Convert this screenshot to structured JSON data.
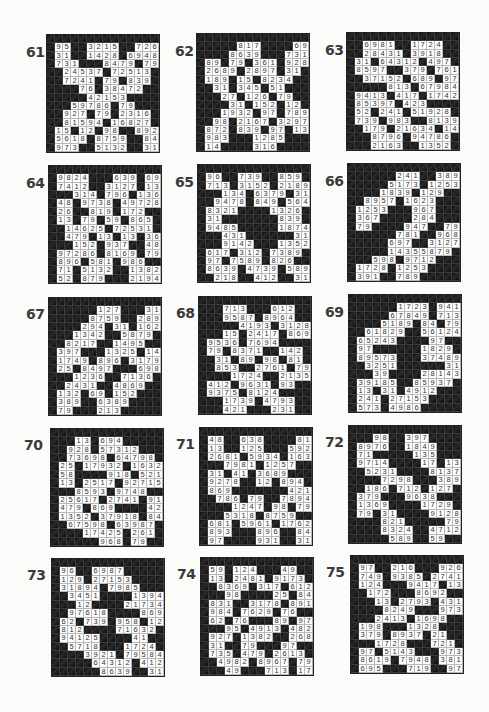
{
  "page": {
    "background": "#fbfbfa",
    "puzzle_label_color": "#3a3a3a",
    "black_cell_color": "#141414",
    "white_cell_color": "#fdfdfd"
  },
  "legend": {
    "black_symbol": "#",
    "empty_symbol": ".",
    "note": "Each grid is 14x14: first row and first column are black header cells; rows below list the 13 remaining rows, 13 chars each."
  },
  "puzzles": [
    {
      "number": "61",
      "label_pos": [
        26,
        44
      ],
      "grid_pos": [
        46,
        34
      ],
      "rows": [
        "95##3215##726",
        "31##1428#6948",
        "731###8479#79",
        "#24537#72513#",
        "#7241#79#839#",
        "###76#38472##",
        "####42153####",
        "##59786#79###",
        "#927#79#2316#",
        "#81594#16827#",
        "15#12#98##892",
        "5618#8759##84",
        "973##5132##31"
      ]
    },
    {
      "number": "62",
      "label_pos": [
        175,
        43
      ],
      "grid_pos": [
        196,
        33
      ],
      "rows": [
        "####817####69",
        "###8639###731",
        "89#79#361#928",
        "2689#2897#31#",
        "189#15#8234##",
        "#31#345#51###",
        "##27#126#79##",
        "###31#152#12#",
        "##1932#97#789",
        "#98#2167#3297",
        "872#839#97#13",
        "983###1285###",
        "14####316####"
      ]
    },
    {
      "number": "63",
      "label_pos": [
        325,
        42
      ],
      "grid_pos": [
        346,
        32
      ],
      "rows": [
        "#6981##1724##",
        "#28431#3918##",
        "31#64312#497#",
        "8597##379#761",
        "#37152#689#97",
        "####813#67984",
        "9413#417#1742",
        "85397#423####",
        "52#241#51928#",
        "739#983##8139",
        "#179#21634#14",
        "##8796#94786#",
        "##2163##1352#"
      ]
    },
    {
      "number": "64",
      "label_pos": [
        26,
        175
      ],
      "grid_pos": [
        48,
        165
      ],
      "rows": [
        "9824###639#69",
        "7412##3127#13",
        "##314#796#136",
        "48#9738#49728",
        "26##819#172##",
        "13#79#59#865#",
        "#14625#72531#",
        "#479#13#13#36",
        "##152#937##48",
        "97286#8169#79",
        "896#581#986##",
        "71#5132##1382",
        "52#879###2194"
      ]
    },
    {
      "number": "65",
      "label_pos": [
        175,
        174
      ],
      "grid_pos": [
        197,
        164
      ],
      "rows": [
        "96##739##859#",
        "713#3152#2189",
        "##134#6379#31",
        "#9478#849#564",
        "8321####1326#",
        "31#######839#",
        "9485#####1874",
        "##431######31",
        "##9142###1352",
        "617#312#7389#",
        "97#7589#826##",
        "8639#4739#589",
        "#218##412##31"
      ]
    },
    {
      "number": "66",
      "label_pos": [
        325,
        173
      ],
      "grid_pos": [
        347,
        163
      ],
      "rows": [
        "#####241##389",
        "####5173#1253",
        "###1839#129##",
        "#8957#1623###",
        "1253###967###",
        "367####284###",
        "79####947##79",
        "#####781##968",
        "####697##3127",
        "####14355879#",
        "##598#9712###",
        "1728#1253####",
        "391##789#####"
      ]
    },
    {
      "number": "67",
      "label_pos": [
        26,
        306
      ],
      "grid_pos": [
        48,
        297
      ],
      "rows": [
        "#####127###31",
        "####8759##289",
        "###294#31#162",
        "##1342##5879#",
        "#8217##1495##",
        "397###1325#14",
        "1749#896#3179",
        "25#8497###698",
        "##1236##7136#",
        "#2431##4869##",
        "132#69#152###",
        "389##6389####",
        "79###213#####"
      ]
    },
    {
      "number": "68",
      "label_pos": [
        176,
        305
      ],
      "grid_pos": [
        198,
        296
      ],
      "rows": [
        "##713###612##",
        "##9587#8964##",
        "####4193#3128",
        "##15#2417#869",
        "9536#7694####",
        "79#8371##142#",
        "#31#89#98#81#",
        "#853##2761#79",
        "###1724##2135",
        "412#9631#93##",
        "9375#8124####",
        "##1739#4793##",
        "##421###231##"
      ]
    },
    {
      "number": "69",
      "label_pos": [
        325,
        304
      ],
      "grid_pos": [
        348,
        294
      ],
      "rows": [
        "#####1723#941",
        "####67849#713",
        "###5189#84#79",
        "#61829##56124",
        "65243####97##",
        "97######1829#",
        "89573###37489",
        "#3251######31",
        "##39####28143",
        "39185##85937#",
        "13#31#4912###",
        "241#27153####",
        "573#4986#####"
      ]
    },
    {
      "number": "70",
      "label_pos": [
        24,
        437
      ],
      "grid_pos": [
        50,
        428
      ],
      "rows": [
        "##13#694#####",
        "#928#57312###",
        "#73698#64798#",
        "25#17932#1632",
        "58####918#521",
        "13#2517#92715",
        "##8593#9748##",
        "25617#2741#91",
        "479#869####42",
        "1352#37918#84",
        "#67598#63987#",
        "###17425#261#",
        "#####968#79##"
      ]
    },
    {
      "number": "71",
      "label_pos": [
        176,
        436
      ],
      "grid_pos": [
        199,
        427
      ],
      "rows": [
        "48##638####81",
        "13##125###592",
        "2681#5934#163",
        "##7981#1257##",
        "31#41#3689###",
        "9278##12#894#",
        "869#######421",
        "#786#79##7894",
        "###1247#98#79",
        "##5318#8759##",
        "681#5961#1762",
        "893###896##84",
        "97####931##31"
      ]
    },
    {
      "number": "72",
      "label_pos": [
        325,
        434
      ],
      "grid_pos": [
        348,
        425
      ],
      "rows": [
        "##98##397####",
        "8976##1849###",
        "71#####135###",
        "9714####17#13",
        "#5231####8137",
        "###7298###389",
        "#186#712#127#",
        "379###9638###",
        "1369####1729#",
        "79#31####9128",
        "###821#####79",
        "###8324##4712",
        "####589##59##"
      ]
    },
    {
      "number": "73",
      "label_pos": [
        27,
        567
      ],
      "grid_pos": [
        51,
        558
      ],
      "rows": [
        "96##6987#####",
        "129#27153####",
        "31894#7985###",
        "#3451####1394",
        "##12####21734",
        "#97618####869",
        "62#739#958#12",
        "812####71632#",
        "94125####41##",
        "#5718###1724#",
        "###3921#79584",
        "####64312#412",
        "#####8639##31"
      ]
    },
    {
      "number": "74",
      "label_pos": [
        177,
        566
      ],
      "grid_pos": [
        200,
        557
      ],
      "rows": [
        "59#124###49##",
        "13#2481#9173#",
        "#8369#317#612",
        "##98####25#84",
        "831##3178#891",
        "984#7629#76##",
        "62#76###89#97",
        "##95#4913#482",
        "927#1382##268",
        "31##79###97##",
        "735#479#2613#",
        "#4982#8967#79",
        "##49###713#17"
      ]
    },
    {
      "number": "75",
      "label_pos": [
        326,
        564
      ],
      "grid_pos": [
        350,
        555
      ],
      "rows": [
        "97##216###926",
        "749#9385#2741",
        "124###9417#13",
        "#172###8692##",
        "##13#2793#431",
        "###8249###973",
        "##2413#1698##",
        "198###1328###",
        "379#8937#21##",
        "##1728###721#",
        "97#5143###973",
        "8619#7948#381",
        "695###719##97"
      ]
    }
  ]
}
